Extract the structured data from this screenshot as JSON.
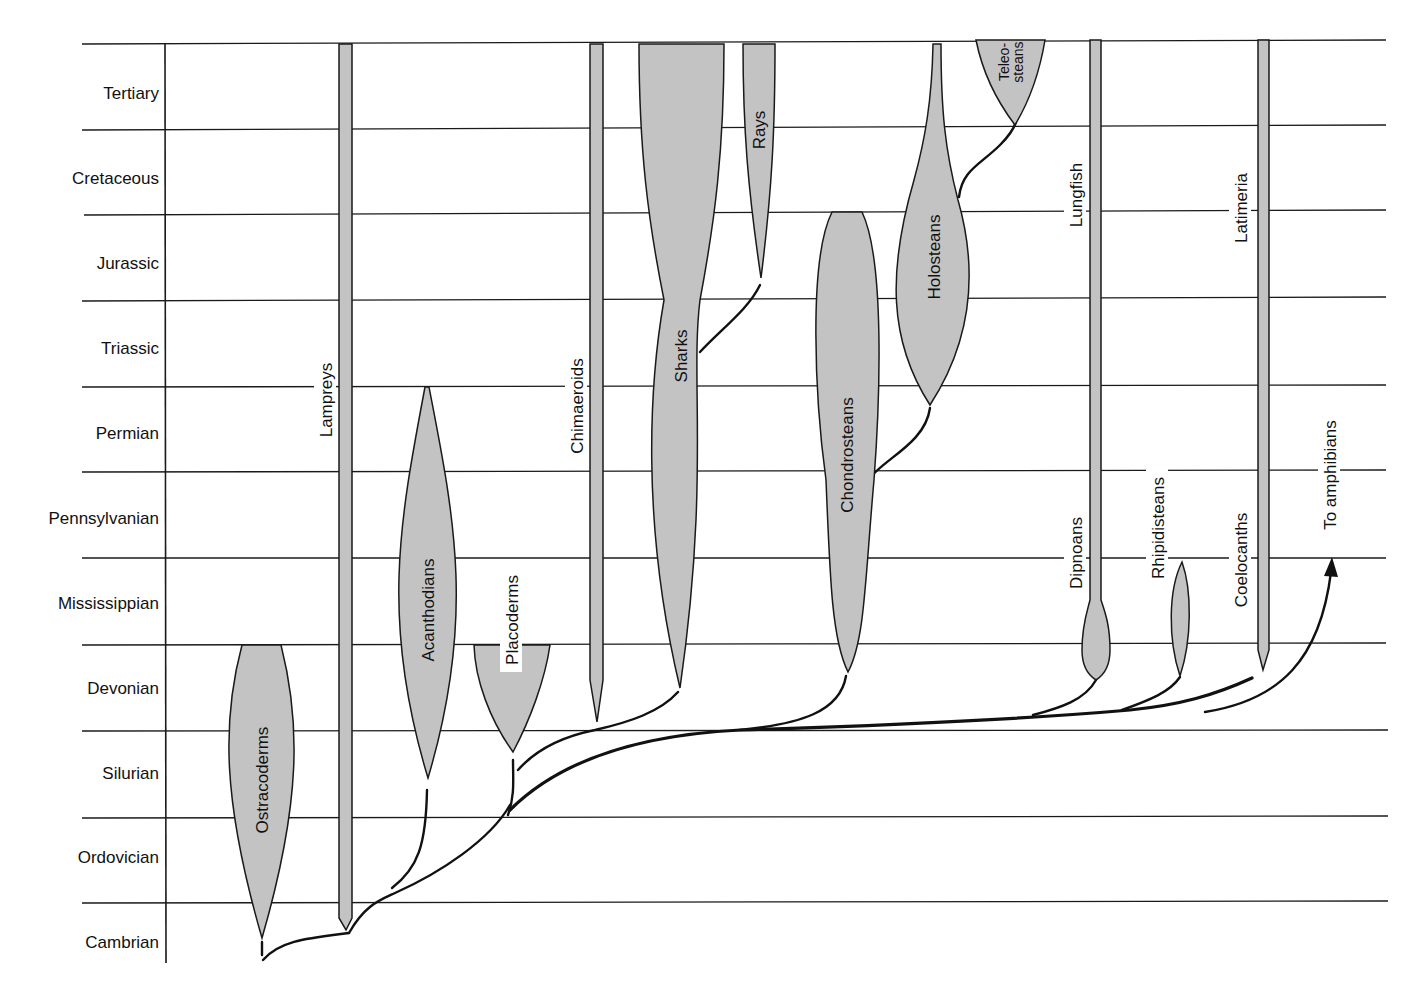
{
  "diagram": {
    "type": "phylogenetic-spindle-diagram",
    "colors": {
      "fill": "#c3c3c3",
      "line": "#1a1a1a",
      "background": "#ffffff"
    },
    "periods": [
      "Tertiary",
      "Cretaceous",
      "Jurassic",
      "Triassic",
      "Permian",
      "Pennsylvanian",
      "Mississippian",
      "Devonian",
      "Silurian",
      "Ordovician",
      "Cambrian"
    ],
    "taxa": {
      "ostracoderms": "Ostracoderms",
      "lampreys": "Lampreys",
      "acanthodians": "Acanthodians",
      "placoderms": "Placoderms",
      "chimaeroids": "Chimaeroids",
      "sharks": "Sharks",
      "rays": "Rays",
      "chondrosteans": "Chondrosteans",
      "holosteans": "Holosteans",
      "teleosteans_line1": "Teleo-",
      "teleosteans_line2": "steans",
      "lungfish": "Lungfish",
      "dipnoans": "Dipnoans",
      "rhipidisteans": "Rhipidisteans",
      "latimeria": "Latimeria",
      "coelocanths": "Coelocanths",
      "to_amphibians": "To amphibians"
    }
  }
}
